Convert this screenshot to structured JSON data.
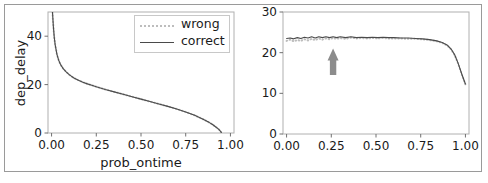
{
  "figure": {
    "background": "#ffffff",
    "frame_color": "#9a9a9a"
  },
  "chart_data": [
    {
      "type": "line",
      "panel": "left",
      "title": "",
      "xlabel": "prob_ontime",
      "ylabel": "dep_delay",
      "xlim": [
        -0.02,
        1.02
      ],
      "ylim": [
        0,
        50
      ],
      "xticks": [
        0.0,
        0.25,
        0.5,
        0.75,
        1.0
      ],
      "xticklabels": [
        "0.00",
        "0.25",
        "0.50",
        "0.75",
        "1.00"
      ],
      "yticks": [
        0,
        20,
        40
      ],
      "yticklabels": [
        "0",
        "20",
        "40"
      ],
      "grid": false,
      "legend_position": "upper right",
      "series": [
        {
          "name": "wrong",
          "style": "dotted",
          "color": "#bdbdbd",
          "x": [
            0.005,
            0.01,
            0.015,
            0.02,
            0.03,
            0.04,
            0.05,
            0.065,
            0.08,
            0.1,
            0.125,
            0.15,
            0.175,
            0.2,
            0.225,
            0.25,
            0.3,
            0.35,
            0.4,
            0.45,
            0.5,
            0.55,
            0.6,
            0.65,
            0.7,
            0.75,
            0.8,
            0.85,
            0.88,
            0.9,
            0.92,
            0.935,
            0.945,
            0.95
          ],
          "y": [
            50.0,
            44.0,
            39.5,
            36.5,
            32.5,
            30.0,
            28.3,
            26.6,
            25.4,
            24.0,
            22.7,
            21.8,
            21.0,
            20.3,
            19.7,
            19.1,
            18.0,
            17.0,
            16.0,
            15.0,
            14.0,
            13.0,
            12.0,
            11.0,
            9.9,
            8.7,
            7.3,
            5.6,
            4.4,
            3.5,
            2.4,
            1.5,
            0.7,
            0.0
          ]
        },
        {
          "name": "correct",
          "style": "solid",
          "color": "#4a4a4a",
          "x": [
            0.005,
            0.01,
            0.015,
            0.02,
            0.03,
            0.04,
            0.05,
            0.065,
            0.08,
            0.1,
            0.125,
            0.15,
            0.175,
            0.2,
            0.225,
            0.25,
            0.3,
            0.35,
            0.4,
            0.45,
            0.5,
            0.55,
            0.6,
            0.65,
            0.7,
            0.75,
            0.8,
            0.85,
            0.88,
            0.9,
            0.92,
            0.935,
            0.945,
            0.95
          ],
          "y": [
            50.0,
            44.0,
            39.5,
            36.5,
            32.5,
            30.0,
            28.3,
            26.6,
            25.4,
            24.0,
            22.7,
            21.8,
            21.0,
            20.3,
            19.7,
            19.1,
            18.0,
            17.0,
            16.0,
            15.0,
            14.0,
            13.0,
            12.0,
            11.0,
            9.9,
            8.7,
            7.3,
            5.6,
            4.4,
            3.5,
            2.4,
            1.5,
            0.7,
            0.0
          ]
        }
      ]
    },
    {
      "type": "line",
      "panel": "right",
      "title": "",
      "xlabel": "prob_ontime",
      "ylabel": "taxi_out",
      "xlim": [
        -0.02,
        1.02
      ],
      "ylim": [
        0,
        30
      ],
      "xticks": [
        0.0,
        0.25,
        0.5,
        0.75,
        1.0
      ],
      "xticklabels": [
        "0.00",
        "0.25",
        "0.50",
        "0.75",
        "1.00"
      ],
      "yticks": [
        0,
        10,
        20,
        30
      ],
      "yticklabels": [
        "0",
        "10",
        "20",
        "30"
      ],
      "grid": false,
      "legend_position": "lower left",
      "annotation": {
        "type": "up-arrow",
        "color": "#8c8c8c",
        "x": 0.26,
        "y_tail": 14.5,
        "y_head": 21.0
      },
      "series": [
        {
          "name": "wrong",
          "style": "dotted",
          "color": "#bdbdbd",
          "x": [
            0.0,
            0.02,
            0.04,
            0.06,
            0.08,
            0.1,
            0.12,
            0.14,
            0.16,
            0.18,
            0.2,
            0.22,
            0.24,
            0.26,
            0.28,
            0.3,
            0.33,
            0.36,
            0.39,
            0.42,
            0.45,
            0.48,
            0.51,
            0.54,
            0.57,
            0.6,
            0.64,
            0.68,
            0.72,
            0.76,
            0.8,
            0.84,
            0.87,
            0.9,
            0.92,
            0.94,
            0.96,
            0.98,
            1.0
          ],
          "y": [
            22.9,
            23.2,
            22.8,
            23.1,
            22.9,
            23.3,
            23.0,
            23.4,
            23.1,
            23.5,
            23.2,
            23.5,
            23.3,
            23.6,
            23.4,
            23.6,
            23.4,
            23.7,
            23.5,
            23.6,
            23.5,
            23.6,
            23.5,
            23.6,
            23.5,
            23.5,
            23.5,
            23.4,
            23.4,
            23.3,
            23.1,
            22.8,
            22.4,
            21.7,
            20.8,
            19.4,
            17.2,
            14.6,
            12.2
          ]
        },
        {
          "name": "correct",
          "style": "solid",
          "color": "#4a4a4a",
          "x": [
            0.0,
            0.02,
            0.04,
            0.06,
            0.08,
            0.1,
            0.12,
            0.14,
            0.16,
            0.18,
            0.2,
            0.22,
            0.24,
            0.26,
            0.28,
            0.3,
            0.33,
            0.36,
            0.39,
            0.42,
            0.45,
            0.48,
            0.51,
            0.54,
            0.57,
            0.6,
            0.64,
            0.68,
            0.72,
            0.76,
            0.8,
            0.84,
            0.87,
            0.9,
            0.92,
            0.94,
            0.96,
            0.98,
            1.0
          ],
          "y": [
            23.5,
            23.6,
            23.4,
            23.7,
            23.5,
            23.8,
            23.6,
            23.9,
            23.6,
            23.9,
            23.7,
            23.9,
            23.7,
            23.9,
            23.7,
            23.9,
            23.7,
            23.9,
            23.7,
            23.8,
            23.7,
            23.8,
            23.7,
            23.8,
            23.7,
            23.7,
            23.6,
            23.6,
            23.5,
            23.4,
            23.2,
            22.9,
            22.5,
            21.8,
            20.9,
            19.5,
            17.3,
            14.7,
            12.3
          ]
        }
      ]
    }
  ]
}
